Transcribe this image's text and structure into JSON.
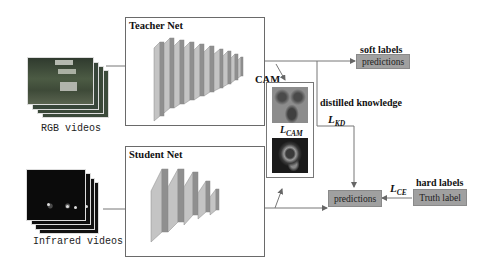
{
  "teacher": {
    "title": "Teacher Net",
    "layers": 10
  },
  "student": {
    "title": "Student Net",
    "layers": 5
  },
  "inputs": {
    "rgb": {
      "caption": "RGB videos"
    },
    "infrared": {
      "caption": "Infrared videos"
    }
  },
  "cam": {
    "label": "CAM",
    "loss_main": "L",
    "loss_sub": "CAM"
  },
  "distilled": {
    "label": "distilled knowledge"
  },
  "kd_loss": {
    "main": "L",
    "sub": "KD"
  },
  "ce_loss": {
    "main": "L",
    "sub": "CE"
  },
  "soft": {
    "title": "soft labels",
    "box": "predictions"
  },
  "student_out": {
    "box": "predictions"
  },
  "hard": {
    "title": "hard labels",
    "box": "Truth label"
  },
  "colors": {
    "layer_front": "#9a9a9a",
    "layer_side": "#7f7f7f",
    "layer_top": "#c4c4c4",
    "label_box": "#a0a0a0",
    "line": "#777777"
  }
}
